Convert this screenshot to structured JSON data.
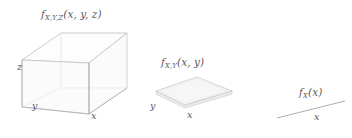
{
  "figure": {
    "background_color": "#ffffff",
    "stroke_color": "#b7b7b9",
    "fill_color": "#f7f7f7",
    "text_color": "#5a5a5c",
    "panels": [
      {
        "id": "trivariate",
        "kind": "cube",
        "density_label": {
          "base": "f",
          "subscript": "X,Y,Z",
          "args": "(x, y, z)",
          "full": "f_X,Y,Z(x, y, z)"
        },
        "axes": [
          {
            "name": "z-axis-label",
            "text": "z"
          },
          {
            "name": "y-axis-label",
            "text": "y"
          },
          {
            "name": "x-axis-label",
            "text": "x"
          }
        ]
      },
      {
        "id": "bivariate",
        "kind": "plane",
        "density_label": {
          "base": "f",
          "subscript": "X,Y",
          "args": "(x, y)",
          "full": "f_X,Y(x, y)"
        },
        "axes": [
          {
            "name": "y-axis-label",
            "text": "y"
          },
          {
            "name": "x-axis-label",
            "text": "x"
          }
        ]
      },
      {
        "id": "univariate",
        "kind": "line",
        "density_label": {
          "base": "f",
          "subscript": "X",
          "args": "(x)",
          "full": "f_X(x)"
        },
        "axes": [
          {
            "name": "x-axis-label",
            "text": "x"
          }
        ]
      }
    ]
  }
}
